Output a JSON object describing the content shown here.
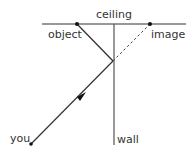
{
  "diagram": {
    "labels": {
      "ceiling": "ceiling",
      "object": "object",
      "image": "image",
      "you": "you",
      "wall": "wall"
    },
    "colors": {
      "line": "#333333",
      "dashed": "#444444",
      "dot": "#111111",
      "background": "#ffffff"
    },
    "points": {
      "object": [
        77,
        24
      ],
      "image": [
        150,
        24
      ],
      "reflection": [
        113,
        61
      ],
      "you": [
        31,
        144
      ]
    }
  }
}
